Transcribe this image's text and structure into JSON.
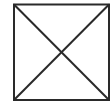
{
  "figure": {
    "shape": "square-with-diagonals",
    "stroke_color": "#2a2a2a",
    "background": "#ffffff",
    "square": {
      "x": 14,
      "y": 4,
      "width": 95,
      "height": 96
    },
    "stroke_width": 2
  }
}
